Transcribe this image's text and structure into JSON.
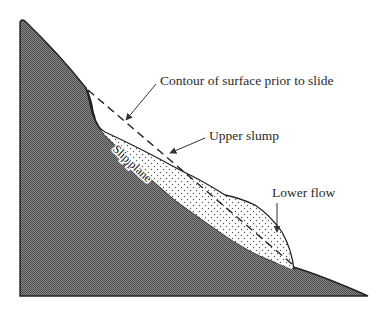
{
  "diagram": {
    "labels": {
      "contour": "Contour of surface prior to slide",
      "upper_slump": "Upper slump",
      "slip_plane": "Slip plane",
      "lower_flow": "Lower flow"
    },
    "colors": {
      "bedrock_fill": "#6e6e6e",
      "outline": "#222222",
      "slide_fill": "#ffffff",
      "stipple": "#555555",
      "text": "#2a2a2a"
    },
    "line_styles": {
      "prior_surface": "dashed",
      "arrows": "solid"
    }
  }
}
